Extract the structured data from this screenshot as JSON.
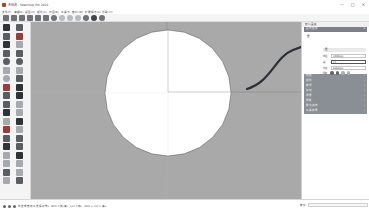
{
  "window": {
    "title": "无标题 - SketchUp Pro 2021",
    "controls": [
      "—",
      "□",
      "✕"
    ]
  },
  "menubar": {
    "items": [
      "文件(F)",
      "编辑(E)",
      "视图(V)",
      "相机(C)",
      "绘图(R)",
      "工具(T)",
      "窗口(W)",
      "扩展程序(x)",
      "帮助(H)"
    ]
  },
  "toolbar": {
    "icons": [
      "new-icon",
      "open-icon",
      "save-icon",
      "cut-icon",
      "copy-icon",
      "paste-icon",
      "erase-icon",
      "undo-icon",
      "redo-icon",
      "print-icon",
      "model-info-icon",
      "warehouse-icon",
      "extension-icon"
    ]
  },
  "left_toolbar": {
    "icons": [
      "select-icon",
      "component-icon",
      "paint-bucket-icon",
      "eraser-icon",
      "line-icon",
      "freehand-icon",
      "rectangle-icon",
      "rotated-rectangle-icon",
      "circle-icon",
      "polygon-icon",
      "arc-icon",
      "pie-icon",
      "push-pull-icon",
      "follow-me-icon",
      "move-icon",
      "rotate-icon",
      "offset-icon",
      "scale-icon",
      "tape-measure-icon",
      "protractor-icon",
      "dimension-icon",
      "text-icon",
      "axes-icon",
      "3d-text-icon",
      "orbit-icon",
      "pan-icon",
      "zoom-icon",
      "zoom-window-icon",
      "zoom-extents-icon",
      "previous-view-icon",
      "walk-icon",
      "look-around-icon",
      "position-camera-icon",
      "section-plane-icon",
      "display-section-icon",
      "section-fill-icon",
      "sandbox-icon",
      "warehouse-icon"
    ]
  },
  "canvas": {
    "background": "#a9a9a9",
    "shape": "circle",
    "circle_fill": "#ffffff",
    "annotation_arrow_color": "#2b2f36"
  },
  "tray": {
    "title": "默认面板",
    "entity_info": {
      "header": "图元信息",
      "type": "圆",
      "section_label": "圆",
      "rows": [
        {
          "label": "半径",
          "value": "1000mm"
        },
        {
          "label": "段",
          "value": "24"
        },
        {
          "label": "长度",
          "value": "6265mm"
        }
      ],
      "flags_label": "阴影",
      "flags": [
        "cast-shadow-icon",
        "receive-shadow-icon",
        "hide-icon",
        "lock-icon"
      ]
    },
    "panels": [
      {
        "label": "材质"
      },
      {
        "label": "组件"
      },
      {
        "label": "样式"
      },
      {
        "label": "标记"
      },
      {
        "label": "场景"
      },
      {
        "label": "阴影"
      },
      {
        "label": "柔化边线"
      },
      {
        "label": "工具向导"
      }
    ]
  },
  "statusbar": {
    "text": "单击或拖动以选择对象。Shift = 加/减。Ctrl = 加。Shift + Ctrl = 减。",
    "measure_label": "数值",
    "measure_value": ""
  }
}
